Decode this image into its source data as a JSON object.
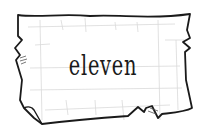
{
  "card": {
    "word": "eleven",
    "style": "hand-drawn torn parchment with faint grid",
    "colors": {
      "outline": "#1a1a1a",
      "grid": "#d8d8d8",
      "paper": "#ffffff",
      "text": "#1a1a1a"
    }
  }
}
